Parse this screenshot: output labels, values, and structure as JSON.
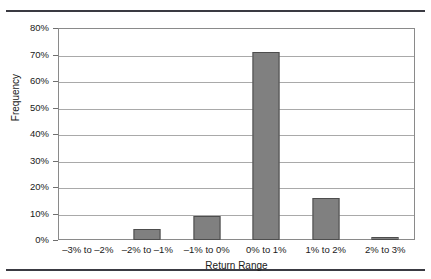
{
  "figure": {
    "y_axis_title": "Frequency",
    "x_axis_title": "Return Range",
    "clipped_caption_above": ""
  },
  "chart_data": {
    "type": "bar",
    "title": "",
    "xlabel": "Return Range",
    "ylabel": "Frequency",
    "categories": [
      "–3% to –2%",
      "–2% to –1%",
      "–1% to 0%",
      "0% to 1%",
      "1% to 2%",
      "2% to 3%"
    ],
    "values": [
      0,
      4,
      9,
      71,
      16,
      1
    ],
    "value_labels": [
      "0%",
      "4%",
      "9%",
      "71%",
      "16%",
      "1%"
    ],
    "ylim": [
      0,
      80
    ],
    "ytick_values": [
      0,
      10,
      20,
      30,
      40,
      50,
      60,
      70,
      80
    ],
    "ytick_labels": [
      "0%",
      "10%",
      "20%",
      "30%",
      "40%",
      "50%",
      "60%",
      "70%",
      "80%"
    ],
    "grid": "horizontal",
    "legend": "none",
    "bar_color": "#808080",
    "bar_border_color": "#4d4d4d",
    "gridline_color": "#a9a9a9",
    "frame_color": "#8a8a8a",
    "background": "#ffffff"
  }
}
